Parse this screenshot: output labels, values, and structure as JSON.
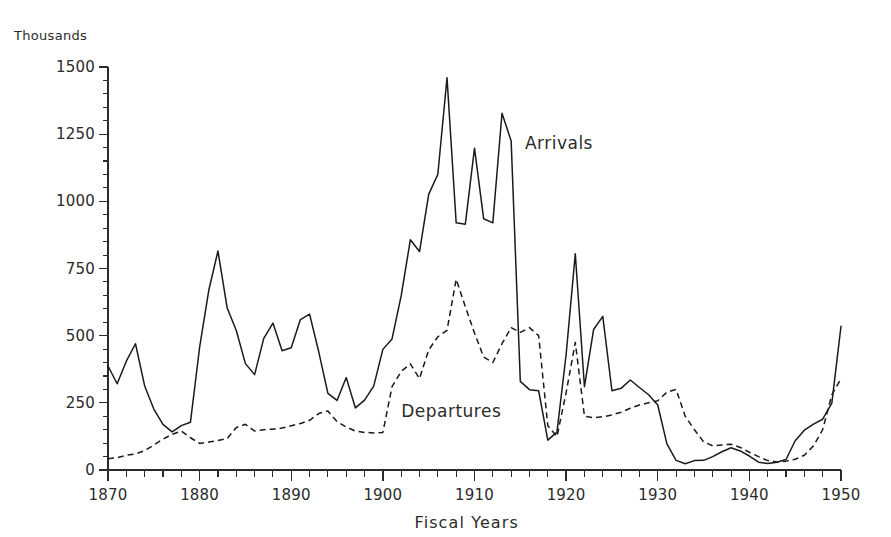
{
  "figure": {
    "units_label": "Thousands",
    "xaxis_title": "Fiscal Years",
    "background_color": "#ffffff",
    "ink_color": "#1a1a1a"
  },
  "chart_data": {
    "type": "line",
    "title": "",
    "subtitle": "",
    "xlabel": "Fiscal Years",
    "ylabel": "Thousands",
    "xlim": [
      1870,
      1950
    ],
    "ylim": [
      0,
      1500
    ],
    "grid": false,
    "legend_position": "inline-annotation",
    "y_major_ticks": [
      0,
      250,
      500,
      750,
      1000,
      1250,
      1500
    ],
    "y_tick_labels": [
      "0",
      "250",
      "500",
      "750",
      "1000",
      "1250",
      "1500"
    ],
    "y_minor_tick_step": 50,
    "x_major_ticks": [
      1870,
      1880,
      1890,
      1900,
      1910,
      1920,
      1930,
      1940,
      1950
    ],
    "x_tick_labels": [
      "1870",
      "1880",
      "1890",
      "1900",
      "1910",
      "1920",
      "1930",
      "1940",
      "1950"
    ],
    "x_minor_tick_step": 2,
    "annotations": [
      {
        "name": "arrivals",
        "text": "Arrivals",
        "x": 1915.5,
        "y": 1215
      },
      {
        "name": "departures",
        "text": "Departures",
        "x": 1902.0,
        "y": 215
      }
    ],
    "series": [
      {
        "name": "Arrivals",
        "style": "solid",
        "color": "#1a1a1a",
        "x": [
          1870,
          1871,
          1872,
          1873,
          1874,
          1875,
          1876,
          1877,
          1878,
          1879,
          1880,
          1881,
          1882,
          1883,
          1884,
          1885,
          1886,
          1887,
          1888,
          1889,
          1890,
          1891,
          1892,
          1893,
          1894,
          1895,
          1896,
          1897,
          1898,
          1899,
          1900,
          1901,
          1902,
          1903,
          1904,
          1905,
          1906,
          1907,
          1908,
          1909,
          1910,
          1911,
          1912,
          1913,
          1914,
          1915,
          1916,
          1917,
          1918,
          1919,
          1920,
          1921,
          1922,
          1923,
          1924,
          1925,
          1926,
          1927,
          1928,
          1929,
          1930,
          1931,
          1932,
          1933,
          1934,
          1935,
          1936,
          1937,
          1938,
          1939,
          1940,
          1941,
          1942,
          1943,
          1944,
          1945,
          1946,
          1947,
          1948,
          1949,
          1950
        ],
        "y": [
          387,
          321,
          405,
          470,
          313,
          227,
          170,
          142,
          165,
          178,
          457,
          669,
          815,
          604,
          519,
          396,
          355,
          490,
          547,
          444,
          455,
          560,
          580,
          440,
          285,
          259,
          344,
          231,
          260,
          312,
          449,
          488,
          649,
          857,
          813,
          1026,
          1101,
          1460,
          920,
          915,
          1198,
          935,
          920,
          1328,
          1225,
          330,
          299,
          295,
          111,
          141,
          430,
          805,
          310,
          523,
          572,
          295,
          304,
          335,
          307,
          280,
          242,
          97,
          36,
          23,
          35,
          36,
          50,
          68,
          83,
          71,
          52,
          29,
          24,
          29,
          39,
          109,
          148,
          171,
          189,
          249,
          535
        ]
      },
      {
        "name": "Departures",
        "style": "dashed",
        "color": "#1a1a1a",
        "x": [
          1870,
          1871,
          1872,
          1873,
          1874,
          1875,
          1876,
          1877,
          1878,
          1879,
          1880,
          1881,
          1882,
          1883,
          1884,
          1885,
          1886,
          1887,
          1888,
          1889,
          1890,
          1891,
          1892,
          1893,
          1894,
          1895,
          1896,
          1897,
          1898,
          1899,
          1900,
          1901,
          1902,
          1903,
          1904,
          1905,
          1906,
          1907,
          1908,
          1909,
          1910,
          1911,
          1912,
          1913,
          1914,
          1915,
          1916,
          1917,
          1918,
          1919,
          1920,
          1921,
          1922,
          1923,
          1924,
          1925,
          1926,
          1927,
          1928,
          1929,
          1930,
          1931,
          1932,
          1933,
          1934,
          1935,
          1936,
          1937,
          1938,
          1939,
          1940,
          1941,
          1942,
          1943,
          1944,
          1945,
          1946,
          1947,
          1948,
          1949,
          1950
        ],
        "y": [
          42,
          46,
          55,
          60,
          72,
          93,
          115,
          133,
          145,
          120,
          99,
          104,
          110,
          117,
          158,
          170,
          145,
          150,
          152,
          156,
          165,
          173,
          185,
          210,
          220,
          180,
          160,
          145,
          140,
          138,
          140,
          310,
          367,
          395,
          340,
          447,
          496,
          520,
          710,
          608,
          510,
          420,
          400,
          470,
          530,
          512,
          530,
          500,
          165,
          124,
          288,
          475,
          200,
          195,
          198,
          205,
          215,
          230,
          242,
          250,
          258,
          290,
          300,
          200,
          150,
          105,
          90,
          93,
          96,
          84,
          66,
          50,
          35,
          30,
          33,
          40,
          55,
          90,
          150,
          280,
          340
        ]
      }
    ]
  }
}
